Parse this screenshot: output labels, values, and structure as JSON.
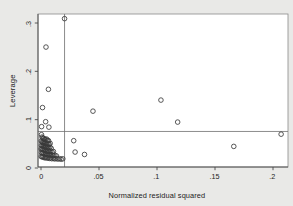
{
  "chart_data": {
    "type": "scatter",
    "title": "",
    "xlabel": "Normalized residual squared",
    "ylabel": "Leverage",
    "xlim": [
      -0.0026,
      0.2128
    ],
    "ylim": [
      -0.0093,
      0.3166
    ],
    "xticks": [
      0,
      0.05,
      0.1,
      0.15,
      0.2
    ],
    "xticklabels": [
      "0",
      ".05",
      ".1",
      ".15",
      ".2"
    ],
    "yticks": [
      0,
      0.1,
      0.2,
      0.3
    ],
    "yticklabels": [
      "0",
      ".1",
      ".2",
      ".3"
    ],
    "grid": false,
    "legend": null,
    "marker": "open-circle",
    "marker_color": "#3a3a3a",
    "marker_size": 4.6,
    "reference_lines": [
      {
        "orientation": "vertical",
        "value": 0.0203,
        "color": "#6f6f6f"
      },
      {
        "orientation": "horizontal",
        "value": 0.0756,
        "color": "#6f6f6f"
      }
    ],
    "points": [
      [
        0.0203,
        0.309
      ],
      [
        0.0043,
        0.2502
      ],
      [
        0.0064,
        0.1628
      ],
      [
        0.0013,
        0.125
      ],
      [
        0.004,
        0.0958
      ],
      [
        0.0005,
        0.0856
      ],
      [
        0.0068,
        0.0845
      ],
      [
        0.1034,
        0.1405
      ],
      [
        0.0448,
        0.1176
      ],
      [
        0.1178,
        0.095
      ],
      [
        0.207,
        0.07
      ],
      [
        0.1662,
        0.0447
      ],
      [
        0.0282,
        0.0565
      ],
      [
        0.0294,
        0.033
      ],
      [
        0.0375,
        0.028
      ],
      [
        0.0004,
        0.069
      ],
      [
        0.0009,
        0.064
      ],
      [
        0.0016,
        0.0625
      ],
      [
        0.0022,
        0.061
      ],
      [
        0.003,
        0.0595
      ],
      [
        0.0037,
        0.0588
      ],
      [
        0.0047,
        0.06
      ],
      [
        0.0056,
        0.0575
      ],
      [
        0.0065,
        0.0565
      ],
      [
        0.0002,
        0.056
      ],
      [
        0.0008,
        0.0545
      ],
      [
        0.0014,
        0.053
      ],
      [
        0.002,
        0.052
      ],
      [
        0.0027,
        0.051
      ],
      [
        0.0034,
        0.0525
      ],
      [
        0.0042,
        0.0505
      ],
      [
        0.005,
        0.0495
      ],
      [
        0.006,
        0.05
      ],
      [
        0.007,
        0.049
      ],
      [
        0.0079,
        0.051
      ],
      [
        0.0003,
        0.047
      ],
      [
        0.001,
        0.046
      ],
      [
        0.0017,
        0.045
      ],
      [
        0.0024,
        0.0465
      ],
      [
        0.0031,
        0.044
      ],
      [
        0.0039,
        0.043
      ],
      [
        0.0048,
        0.0445
      ],
      [
        0.0057,
        0.0425
      ],
      [
        0.0067,
        0.0415
      ],
      [
        0.0077,
        0.043
      ],
      [
        0.0088,
        0.0408
      ],
      [
        0.0001,
        0.0395
      ],
      [
        0.0007,
        0.0385
      ],
      [
        0.0013,
        0.04
      ],
      [
        0.0021,
        0.0375
      ],
      [
        0.0029,
        0.0365
      ],
      [
        0.0036,
        0.038
      ],
      [
        0.0045,
        0.0355
      ],
      [
        0.0054,
        0.0345
      ],
      [
        0.0063,
        0.036
      ],
      [
        0.0073,
        0.0338
      ],
      [
        0.0084,
        0.035
      ],
      [
        0.0096,
        0.033
      ],
      [
        0.0107,
        0.0342
      ],
      [
        0.0005,
        0.0318
      ],
      [
        0.0012,
        0.0305
      ],
      [
        0.0019,
        0.0315
      ],
      [
        0.0026,
        0.0295
      ],
      [
        0.0035,
        0.0285
      ],
      [
        0.0044,
        0.03
      ],
      [
        0.0053,
        0.0278
      ],
      [
        0.0062,
        0.0268
      ],
      [
        0.0072,
        0.0282
      ],
      [
        0.0083,
        0.026
      ],
      [
        0.0094,
        0.0272
      ],
      [
        0.0106,
        0.0255
      ],
      [
        0.0119,
        0.0265
      ],
      [
        0.0133,
        0.025
      ],
      [
        0.0002,
        0.024
      ],
      [
        0.0009,
        0.0228
      ],
      [
        0.0016,
        0.0238
      ],
      [
        0.0025,
        0.022
      ],
      [
        0.0033,
        0.021
      ],
      [
        0.0041,
        0.0225
      ],
      [
        0.0051,
        0.0205
      ],
      [
        0.0061,
        0.0215
      ],
      [
        0.0071,
        0.0198
      ],
      [
        0.0082,
        0.0208
      ],
      [
        0.0093,
        0.0192
      ],
      [
        0.0105,
        0.0202
      ],
      [
        0.0117,
        0.0188
      ],
      [
        0.013,
        0.0196
      ],
      [
        0.0145,
        0.0185
      ],
      [
        0.016,
        0.0192
      ],
      [
        0.0174,
        0.0182
      ],
      [
        0.0188,
        0.019
      ]
    ]
  }
}
